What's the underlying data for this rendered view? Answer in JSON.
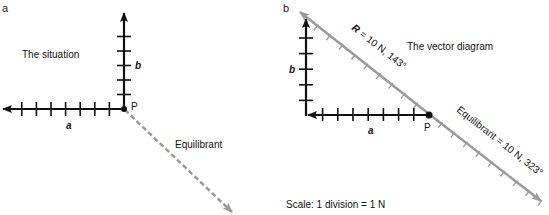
{
  "colors": {
    "vector": "#111111",
    "resultant": "#9a9a9a",
    "background": "#ffffff"
  },
  "panel_a": {
    "label": "a",
    "title": "The situation",
    "point_label": "P",
    "vector_a_label": "a",
    "vector_b_label": "b",
    "equilibrant_label": "Equilibrant",
    "vector_a_divisions": 8,
    "vector_b_divisions": 6
  },
  "panel_b": {
    "label": "b",
    "title": "The vector diagram",
    "point_label": "P",
    "vector_a_label": "a",
    "vector_b_label": "b",
    "resultant_label_symbol": "R",
    "resultant_label_value": " = 10 N, 143°",
    "equilibrant_label": "Equilibrant = 10 N, 323°",
    "scale_text": "Scale: 1 division = 1 N",
    "resultant_divisions": 10,
    "equilibrant_divisions": 10
  }
}
